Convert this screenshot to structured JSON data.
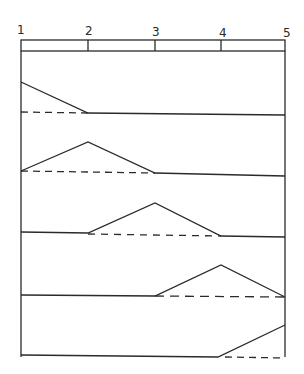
{
  "diagram": {
    "node_labels": [
      "1",
      "2",
      "3",
      "4",
      "5"
    ],
    "node_x": [
      21,
      88,
      155,
      221,
      285
    ],
    "beam": {
      "top": 40,
      "bottom": 51
    },
    "rows": [
      {
        "node": "1",
        "baseline_y": 112,
        "peak_y": 82
      },
      {
        "node": "2",
        "baseline_y": 172,
        "peak_y": 142
      },
      {
        "node": "3",
        "baseline_y": 233,
        "peak_y": 203
      },
      {
        "node": "4",
        "baseline_y": 296,
        "peak_y": 264
      },
      {
        "node": "5",
        "baseline_y": 357,
        "peak_y": 325
      }
    ],
    "colors": {
      "line": "#2a2a2a",
      "background": "#ffffff"
    }
  }
}
